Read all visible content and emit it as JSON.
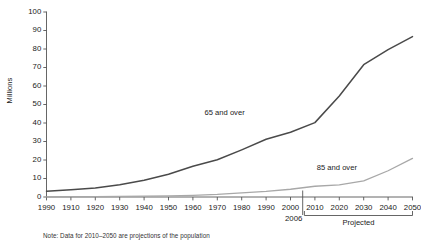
{
  "chart_data": {
    "type": "line",
    "title": "",
    "xlabel": "",
    "ylabel": "Millions",
    "ylim": [
      0,
      100
    ],
    "ytick_values": [
      0,
      10,
      20,
      30,
      40,
      50,
      60,
      70,
      80,
      90,
      100
    ],
    "ytick_labels": [
      "0",
      "10",
      "20",
      "30",
      "40",
      "50",
      "60",
      "70",
      "80",
      "90",
      "100"
    ],
    "grid": false,
    "legend_position": "inline-annotation",
    "categories": [
      "1990",
      "1910",
      "1920",
      "1930",
      "1940",
      "1950",
      "1960",
      "1970",
      "1980",
      "1990",
      "2000",
      "2010",
      "2020",
      "2030",
      "2040",
      "2050"
    ],
    "x": [
      1900,
      1910,
      1920,
      1930,
      1940,
      1950,
      1960,
      1970,
      1980,
      1990,
      2000,
      2010,
      2020,
      2030,
      2040,
      2050
    ],
    "series": [
      {
        "name": "65 and over",
        "color": "#4a4a4a",
        "values": [
          3.1,
          3.9,
          4.9,
          6.6,
          9.0,
          12.3,
          16.6,
          20.1,
          25.5,
          31.2,
          35.0,
          40.2,
          54.6,
          71.5,
          79.7,
          86.7
        ]
      },
      {
        "name": "85 and over",
        "color": "#a8a8a8",
        "values": [
          0.1,
          0.2,
          0.2,
          0.3,
          0.4,
          0.6,
          0.9,
          1.4,
          2.2,
          3.0,
          4.2,
          5.8,
          6.6,
          8.7,
          14.2,
          20.9
        ]
      }
    ],
    "annotations": [
      {
        "text": "65 and over",
        "x": 1973,
        "y": 45.5
      },
      {
        "text": "85 and over",
        "x": 2019,
        "y": 16.0
      }
    ],
    "break_marker": {
      "label": "2006",
      "x": 2005
    },
    "projected_bracket": {
      "label": "Projected",
      "from": 2010,
      "to": 2050
    },
    "note": "Note: Data for 2010–2050 are projections of the population"
  },
  "axis_colors": {
    "axis_line": "#555555",
    "tick": "#555555",
    "text": "#1a1a1a"
  }
}
